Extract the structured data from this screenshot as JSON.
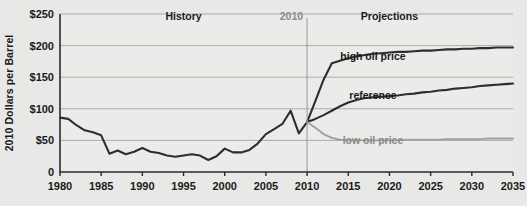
{
  "chart_data": {
    "type": "line",
    "title": "",
    "xlabel": "",
    "ylabel": "2010 Dollars per Barrel",
    "xlim": [
      1980,
      2035
    ],
    "ylim": [
      0,
      250
    ],
    "xticks": [
      1980,
      1985,
      1990,
      1995,
      2000,
      2005,
      2010,
      2015,
      2020,
      2025,
      2030,
      2035
    ],
    "xtick_labels": [
      "1980",
      "1985",
      "1990",
      "1995",
      "2000",
      "2005",
      "2010",
      "2015",
      "2020",
      "2025",
      "2030",
      "2035"
    ],
    "yticks": [
      0,
      50,
      100,
      150,
      200,
      250
    ],
    "ytick_labels": [
      "0",
      "$50",
      "$100",
      "$150",
      "$200",
      "$250"
    ],
    "grid": "horizontal",
    "legend": "inline-labels",
    "annotations": [
      {
        "name": "history-label",
        "text": "History",
        "x": 1995,
        "y": 240
      },
      {
        "name": "projections-label",
        "text": "Projections",
        "x": 2020,
        "y": 240
      },
      {
        "name": "divider-year-label",
        "text": "2010",
        "x": 2010,
        "y": 240
      },
      {
        "name": "high-oil-price-label",
        "text": "high oil price",
        "x": 2018,
        "y": 178
      },
      {
        "name": "reference-label",
        "text": "reference",
        "x": 2018,
        "y": 115
      },
      {
        "name": "low-oil-price-label",
        "text": "low oil price",
        "x": 2018,
        "y": 45
      }
    ],
    "divider_x": 2010,
    "series": [
      {
        "name": "history",
        "color": "#2e2e2e",
        "x": [
          1980,
          1981,
          1982,
          1983,
          1984,
          1985,
          1986,
          1987,
          1988,
          1989,
          1990,
          1991,
          1992,
          1993,
          1994,
          1995,
          1996,
          1997,
          1998,
          1999,
          2000,
          2001,
          2002,
          2003,
          2004,
          2005,
          2006,
          2007,
          2008,
          2009,
          2010
        ],
        "values": [
          86,
          84,
          74,
          66,
          63,
          58,
          29,
          34,
          28,
          32,
          38,
          32,
          30,
          26,
          24,
          26,
          28,
          26,
          19,
          25,
          37,
          31,
          31,
          35,
          45,
          60,
          68,
          76,
          97,
          61,
          79
        ]
      },
      {
        "name": "high oil price",
        "color": "#2e2e2e",
        "x": [
          2010,
          2011,
          2012,
          2013,
          2014,
          2015,
          2016,
          2017,
          2018,
          2019,
          2020,
          2021,
          2022,
          2023,
          2024,
          2025,
          2026,
          2027,
          2028,
          2029,
          2030,
          2031,
          2032,
          2033,
          2034,
          2035
        ],
        "values": [
          79,
          112,
          146,
          172,
          176,
          180,
          183,
          185,
          187,
          188,
          189,
          190,
          190,
          191,
          192,
          192,
          193,
          194,
          194,
          195,
          195,
          196,
          196,
          197,
          197,
          197
        ]
      },
      {
        "name": "reference",
        "color": "#2e2e2e",
        "x": [
          2010,
          2011,
          2012,
          2013,
          2014,
          2015,
          2016,
          2017,
          2018,
          2019,
          2020,
          2021,
          2022,
          2023,
          2024,
          2025,
          2026,
          2027,
          2028,
          2029,
          2030,
          2031,
          2032,
          2033,
          2034,
          2035
        ],
        "values": [
          79,
          84,
          90,
          97,
          104,
          110,
          114,
          117,
          118,
          119,
          120,
          121,
          123,
          124,
          126,
          127,
          129,
          130,
          132,
          133,
          134,
          136,
          137,
          138,
          139,
          140
        ]
      },
      {
        "name": "low oil price",
        "color": "#a0a09e",
        "x": [
          2010,
          2011,
          2012,
          2013,
          2014,
          2015,
          2016,
          2017,
          2018,
          2019,
          2020,
          2021,
          2022,
          2023,
          2024,
          2025,
          2026,
          2027,
          2028,
          2029,
          2030,
          2031,
          2032,
          2033,
          2034,
          2035
        ],
        "values": [
          79,
          70,
          60,
          54,
          51,
          50,
          50,
          50,
          50,
          50,
          50,
          50,
          51,
          51,
          51,
          51,
          51,
          52,
          52,
          52,
          52,
          52,
          53,
          53,
          53,
          53
        ]
      }
    ]
  }
}
